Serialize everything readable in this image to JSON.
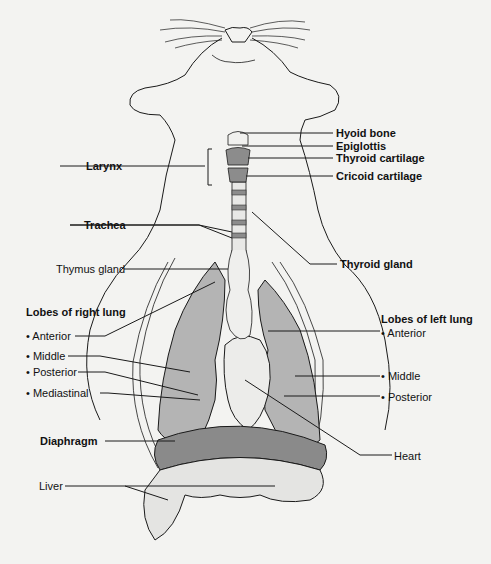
{
  "figure": {
    "colors": {
      "background": "#f3f3f1",
      "outline": "#1a1a1a",
      "lung_fill": "#b4b4b4",
      "heart_fill": "#ececea",
      "diaphragm_fill": "#8a8a8a",
      "cartilage_fill": "#8c8c8c",
      "liver_fill": "#e4e4e2"
    }
  },
  "labels": {
    "hyoid_bone": "Hyoid bone",
    "epiglottis": "Epiglottis",
    "thyroid_cartilage": "Thyroid cartilage",
    "cricoid_cartilage": "Cricoid cartilage",
    "larynx": "Larynx",
    "trachea": "Trachea",
    "thyroid_gland": "Thyroid gland",
    "thymus_gland": "Thymus gland",
    "right_lung_heading": "Lobes of right lung",
    "right_lung_lobes": [
      "• Anterior",
      "• Middle",
      "• Posterior",
      "• Mediastinal"
    ],
    "left_lung_heading": "Lobes of left lung",
    "left_lung_lobes": [
      "• Anterior",
      "• Middle",
      "• Posterior"
    ],
    "diaphragm": "Diaphragm",
    "heart": "Heart",
    "liver": "Liver"
  }
}
